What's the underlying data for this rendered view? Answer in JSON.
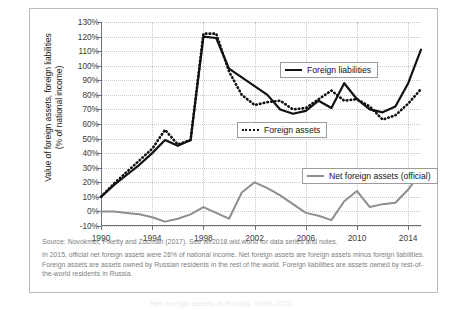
{
  "chart_data": {
    "type": "line",
    "title": "",
    "xlabel": "",
    "ylabel": "Value of foreign assets, foreign liabilities (% of national income)",
    "ylabel_line1": "Value of foreign assets, foreign liabilities",
    "ylabel_line2": "(% of national income)",
    "xlim": [
      1990,
      2015
    ],
    "ylim": [
      -10,
      130
    ],
    "ytick_suffix": "%",
    "yticks": [
      130,
      120,
      110,
      100,
      90,
      80,
      70,
      60,
      50,
      40,
      30,
      20,
      10,
      0,
      -10
    ],
    "ytick_labels": [
      "130%",
      "120%",
      "110%",
      "100%",
      "90%",
      "80%",
      "70%",
      "60%",
      "50%",
      "40%",
      "30%",
      "20%",
      "10%",
      "0%",
      "-10%"
    ],
    "xticks": [
      1990,
      1994,
      1998,
      2002,
      2006,
      2010,
      2014
    ],
    "xtick_labels": [
      "1990",
      "1994",
      "1998",
      "2002",
      "2006",
      "2010",
      "2014"
    ],
    "grid": true,
    "legend_position": "inside",
    "x": [
      1990,
      1991,
      1992,
      1993,
      1994,
      1995,
      1996,
      1997,
      1998,
      1999,
      2000,
      2001,
      2002,
      2003,
      2004,
      2005,
      2006,
      2007,
      2008,
      2009,
      2010,
      2011,
      2012,
      2013,
      2014,
      2015
    ],
    "series": [
      {
        "name": "Foreign liabilities",
        "style": "solid",
        "color": "#111111",
        "values": [
          10,
          18,
          25,
          32,
          40,
          49,
          45,
          49,
          120,
          119,
          98,
          92,
          86,
          80,
          70,
          67,
          69,
          76,
          71,
          88,
          77,
          70,
          68,
          72,
          88,
          111
        ]
      },
      {
        "name": "Foreign assets",
        "style": "dotted",
        "color": "#111111",
        "values": [
          10,
          19,
          27,
          35,
          43,
          56,
          46,
          49,
          122,
          122,
          96,
          80,
          73,
          75,
          76,
          70,
          71,
          77,
          83,
          76,
          77,
          72,
          63,
          66,
          74,
          84
        ]
      },
      {
        "name": "Net foreign assets (official)",
        "style": "solid",
        "color": "#8b8f91",
        "values": [
          0,
          0,
          -1,
          -2,
          -4,
          -7,
          -5,
          -2,
          3,
          -1,
          -5,
          13,
          20,
          16,
          11,
          5,
          -1,
          -3,
          -6,
          7,
          14,
          3,
          5,
          6,
          15,
          27
        ]
      }
    ],
    "legend": [
      {
        "label": "Foreign liabilities",
        "swatch": "solid-black"
      },
      {
        "label": "Foreign assets",
        "swatch": "dotted-black"
      },
      {
        "label": "Net foreign assets (official)",
        "swatch": "solid-gray"
      }
    ]
  },
  "notes": {
    "source_line": "Source:  Novokmet, Piketty and Zucman (2017). See wir2018.wid.world for data series and notes.",
    "body_line": "In 2015, official net foreign assets were 26% of national income. Net foreign assets are foreign assets minus foreign liabilities. Foreign assets are assets owned by Russian residents in the rest of the world. Foreign liabilities are assets owned by rest-of-the-world residents in Russia."
  },
  "caption_ghost": "Net foreign assets in Russia, 1990-2015"
}
